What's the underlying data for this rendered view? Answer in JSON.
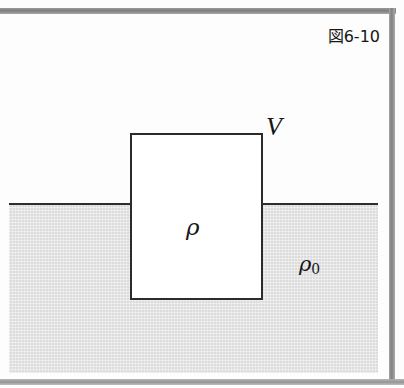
{
  "figure": {
    "caption_label": "図6-10",
    "colors": {
      "fluid_fill": "#dcdcdc",
      "line": "#2b2b2b",
      "frame_bar": "#888888",
      "paper": "#fdfdfd",
      "body_fill": "#ffffff"
    },
    "labels": {
      "volume": "V",
      "body_density": "ρ",
      "fluid_density_symbol": "ρ",
      "fluid_density_subscript": "0"
    },
    "elements": {
      "fluid_region_name": "fluid",
      "surface_line_name": "free-surface",
      "body_name": "immersed-body"
    }
  },
  "chart_data": {
    "type": "diagram",
    "title": "図6-10",
    "items": [
      {
        "name": "fluid-region",
        "label": "ρ0",
        "x": 9,
        "y": 205,
        "width": 369,
        "height": 168
      },
      {
        "name": "free-surface-line",
        "label": "",
        "x": 9,
        "y": 203,
        "width": 369,
        "height": 2
      },
      {
        "name": "immersed-body",
        "label": "V",
        "x": 130,
        "y": 133,
        "width": 133,
        "height": 167
      },
      {
        "name": "body-density-label",
        "label": "ρ",
        "x": 186,
        "y": 216,
        "width": 0,
        "height": 0
      }
    ]
  }
}
